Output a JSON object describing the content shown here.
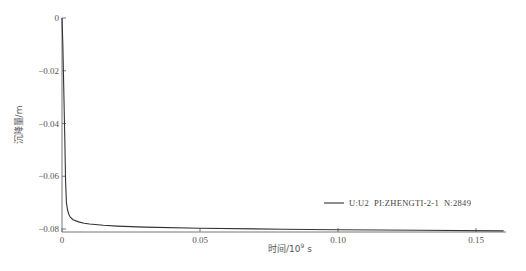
{
  "chart_data": {
    "type": "line",
    "title": "",
    "xlabel": "时间/10^9 s",
    "xlabel_main": "时间/10",
    "xlabel_sup": "9",
    "xlabel_unit": " s",
    "ylabel": "沉降量/m",
    "xlim": [
      0,
      0.16
    ],
    "ylim": [
      -0.081,
      0
    ],
    "x_ticks": [
      0,
      0.05,
      0.1,
      0.15
    ],
    "x_tick_labels": [
      "0",
      "0.05",
      "0.10",
      "0.15"
    ],
    "y_ticks": [
      0,
      -0.02,
      -0.04,
      -0.06,
      -0.08
    ],
    "y_tick_labels": [
      "0",
      "−0.02",
      "−0.04",
      "−0.06",
      "−0.08"
    ],
    "grid": false,
    "legend_position": "lower right",
    "series": [
      {
        "name": "U:U2  PI:ZHENGTI-2-1  N:2849",
        "color": "#333333",
        "x": [
          0,
          0.0003,
          0.0006,
          0.001,
          0.0013,
          0.0016,
          0.002,
          0.0025,
          0.003,
          0.004,
          0.006,
          0.008,
          0.01,
          0.015,
          0.02,
          0.03,
          0.05,
          0.08,
          0.1,
          0.13,
          0.16
        ],
        "y": [
          0,
          -0.01,
          -0.025,
          -0.045,
          -0.062,
          -0.07,
          -0.0728,
          -0.0745,
          -0.0755,
          -0.0765,
          -0.0773,
          -0.0778,
          -0.0781,
          -0.0786,
          -0.0789,
          -0.0793,
          -0.0797,
          -0.0801,
          -0.0803,
          -0.0805,
          -0.0807
        ]
      }
    ]
  },
  "legend": {
    "entry_label": "U:U2  PI:ZHENGTI-2-1  N:2849"
  }
}
